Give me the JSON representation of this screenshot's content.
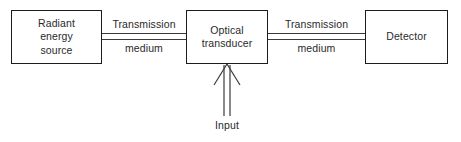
{
  "diagram": {
    "colors": {
      "background": "#ffffff",
      "stroke": "#1c1c1c",
      "line": "#3a3a3a",
      "text": "#2a2a2a"
    },
    "blocks": [
      {
        "id": "source",
        "label": "Radiant\nenergy\nsource"
      },
      {
        "id": "transducer",
        "label": "Optical\ntransducer"
      },
      {
        "id": "detector",
        "label": "Detector"
      }
    ],
    "connectors": [
      {
        "id": "left",
        "from": "source",
        "to": "transducer",
        "label_above": "Transmission",
        "label_below": "medium",
        "style": "double-line"
      },
      {
        "id": "right",
        "from": "transducer",
        "to": "detector",
        "label_above": "Transmission",
        "label_below": "medium",
        "style": "double-line"
      }
    ],
    "input_arrow": {
      "label": "Input",
      "target": "transducer",
      "direction": "up",
      "style": "double-line-open-arrowhead"
    }
  }
}
